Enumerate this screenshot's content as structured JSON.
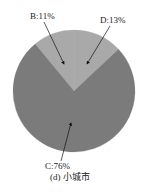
{
  "chart_data": {
    "type": "pie",
    "title": "",
    "caption": "(d) 小城市",
    "categories": [
      "B",
      "D",
      "C"
    ],
    "values": [
      11,
      13,
      76
    ],
    "labels": [
      "B:11%",
      "D:13%",
      "C:76%"
    ],
    "colors": [
      "#a9a9a9",
      "#a9a9a9",
      "#7b7b7b"
    ],
    "start_angle_deg": -39.6,
    "direction": "clockwise",
    "legend": "none",
    "annotations": "arrows from labels into slices"
  },
  "labels": {
    "b": "B:11%",
    "d": "D:13%",
    "c": "C:76%"
  },
  "caption": "(d) 小城市"
}
